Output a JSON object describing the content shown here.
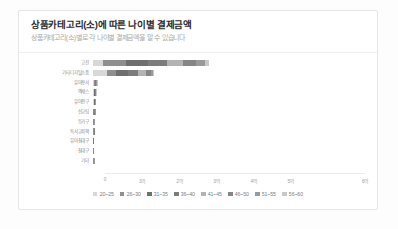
{
  "card": {
    "title": "상품카테고리(소)에 따른 나이별 결제금액",
    "subtitle": "상품카테고리(소)별로 각 나이별 결제금액을 알 수 있습니다"
  },
  "chart_data": {
    "type": "bar",
    "orientation": "horizontal",
    "stacked": true,
    "title": "상품카테고리(소)에 따른 나이별 결제금액",
    "subtitle": "상품카테고리(소)별로 각 나이별 결제금액을 알 수 있습니다",
    "xlabel": "",
    "ylabel": "",
    "xlim": [
      0,
      600000000
    ],
    "grid": false,
    "legend_position": "bottom",
    "xtick_labels": [
      "0",
      "1억",
      "2억",
      "3억",
      "4억",
      "5억",
      "6억"
    ],
    "xtick_values": [
      0,
      100000000,
      200000000,
      300000000,
      400000000,
      500000000,
      600000000
    ],
    "categories": [
      "고전",
      "기타디지털소품",
      "유아용서",
      "액세스",
      "유아완구",
      "선교팀",
      "등가구",
      "독서교육책",
      "유아침대구",
      "침대구",
      "기타"
    ],
    "series": [
      {
        "name": "20~25",
        "color": "#d8d8d8",
        "values": [
          22000000,
          30000000,
          1800000,
          1500000,
          1300000,
          900000,
          800000,
          600000,
          400000,
          300000,
          700000
        ]
      },
      {
        "name": "26~30",
        "color": "#8f8f8f",
        "values": [
          48000000,
          18000000,
          1500000,
          1200000,
          1100000,
          700000,
          600000,
          500000,
          300000,
          250000,
          600000
        ]
      },
      {
        "name": "31~35",
        "color": "#6f6f6f",
        "values": [
          46000000,
          26000000,
          1300000,
          1000000,
          900000,
          600000,
          500000,
          400000,
          250000,
          200000,
          500000
        ]
      },
      {
        "name": "36~40",
        "color": "#7c7c7c",
        "values": [
          40000000,
          22000000,
          1100000,
          900000,
          800000,
          500000,
          450000,
          350000,
          200000,
          180000,
          450000
        ]
      },
      {
        "name": "41~45",
        "color": "#b3b3b3",
        "values": [
          34000000,
          16000000,
          900000,
          700000,
          600000,
          400000,
          350000,
          280000,
          160000,
          140000,
          350000
        ]
      },
      {
        "name": "46~50",
        "color": "#858585",
        "values": [
          28000000,
          10000000,
          700000,
          550000,
          450000,
          300000,
          260000,
          200000,
          120000,
          100000,
          260000
        ]
      },
      {
        "name": "51~55",
        "color": "#9a9a9a",
        "values": [
          18000000,
          5000000,
          450000,
          350000,
          300000,
          200000,
          170000,
          130000,
          80000,
          60000,
          170000
        ]
      },
      {
        "name": "56~60",
        "color": "#c9c9c9",
        "values": [
          9000000,
          2500000,
          250000,
          200000,
          160000,
          110000,
          90000,
          70000,
          40000,
          30000,
          90000
        ]
      }
    ],
    "totals": [
      245000000,
      129500000,
      8000000,
      6400000,
      5610000,
      3710000,
      3220000,
      2530000,
      1550000,
      1260000,
      3120000
    ]
  }
}
